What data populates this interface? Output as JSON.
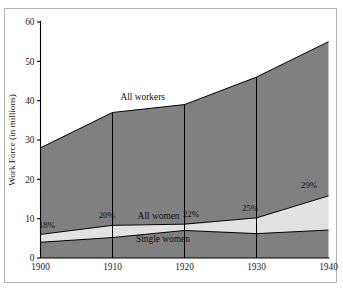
{
  "chart_data": {
    "type": "area",
    "title": "",
    "subtitle": "",
    "xlabel": "",
    "ylabel": "Work Force (in millions)",
    "x": [
      1900,
      1910,
      1920,
      1930,
      1940
    ],
    "xticklabels": [
      "1900",
      "1910",
      "1920",
      "1930",
      "1940"
    ],
    "xlim": [
      1900,
      1940
    ],
    "ylim": [
      0,
      60
    ],
    "yticks": [
      0,
      10,
      20,
      30,
      40,
      50,
      60
    ],
    "yticklabels": [
      "0",
      "10",
      "20",
      "30",
      "40",
      "50",
      "60"
    ],
    "grid": false,
    "legend": "inline-labels",
    "series": [
      {
        "name": "All workers",
        "label": "All workers",
        "values": [
          28,
          37,
          39,
          46,
          55
        ],
        "fill_color": "#808080",
        "line_color": "#000000"
      },
      {
        "name": "All women",
        "label": "All women",
        "values": [
          6,
          8.3,
          8.6,
          10.2,
          15.8
        ],
        "fill_color": "#e2e2e2",
        "line_color": "#000000"
      },
      {
        "name": "Single women",
        "label": "Single women",
        "values": [
          4,
          5.2,
          7,
          6.2,
          7.1
        ],
        "fill_color": "#808080",
        "line_color": "#000000"
      }
    ],
    "annotations": [
      {
        "text": "18%",
        "x": 1900.9,
        "y": 7.6
      },
      {
        "text": "20%",
        "x": 1909.2,
        "y": 10.1
      },
      {
        "text": "22%",
        "x": 1920.9,
        "y": 10.4
      },
      {
        "text": "25%",
        "x": 1929.1,
        "y": 11.9
      },
      {
        "text": "29%",
        "x": 1937.3,
        "y": 17.9
      }
    ],
    "series_label_positions": [
      {
        "text": "All workers",
        "x": 1914.2,
        "y": 40.1
      },
      {
        "text": "All women",
        "x": 1916.4,
        "y": 10.0
      },
      {
        "text": "Single women",
        "x": 1917.0,
        "y": 4.1
      }
    ],
    "dividers": [
      1910,
      1920,
      1930
    ],
    "colors": {
      "dark_fill": "#808080",
      "light_fill": "#e2e2e2",
      "axis": "#000000",
      "frame": "#b4b4b4",
      "background": "#ffffff"
    }
  }
}
